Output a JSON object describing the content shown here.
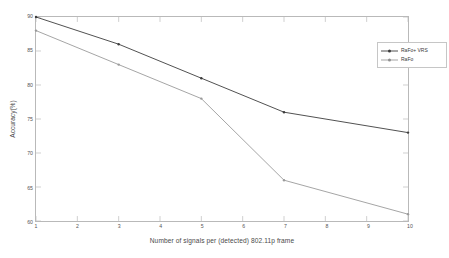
{
  "chart_data": {
    "type": "line",
    "title": "",
    "xlabel": "Number of signals per (detected) 802.11p frame",
    "ylabel": "Accuracy(%)",
    "xlim": [
      1,
      10
    ],
    "ylim": [
      60,
      90
    ],
    "xticks": [
      "1",
      "2",
      "3",
      "4",
      "5",
      "6",
      "7",
      "8",
      "9",
      "10"
    ],
    "yticks": [
      "90",
      "85",
      "80",
      "75",
      "70",
      "65",
      "60"
    ],
    "grid": false,
    "legend_position": "top-right",
    "x": [
      1,
      3,
      5,
      7,
      10
    ],
    "series": [
      {
        "name": "RaFo+ VRS",
        "values": [
          90,
          86,
          81,
          76,
          73
        ],
        "color": "#3c3c3c",
        "marker": "point"
      },
      {
        "name": "RaFo",
        "values": [
          88,
          83,
          78,
          66,
          61
        ],
        "color": "#9a9a9a",
        "marker": "point"
      }
    ]
  },
  "legend": {
    "entries": [
      {
        "label": "RaFo+ VRS"
      },
      {
        "label": "RaFo"
      }
    ]
  },
  "colors": {
    "series_1": "#3c3c3c",
    "series_2": "#9a9a9a",
    "axis": "#b9b9b9",
    "text": "#4a4a4a",
    "background": "#ffffff"
  }
}
